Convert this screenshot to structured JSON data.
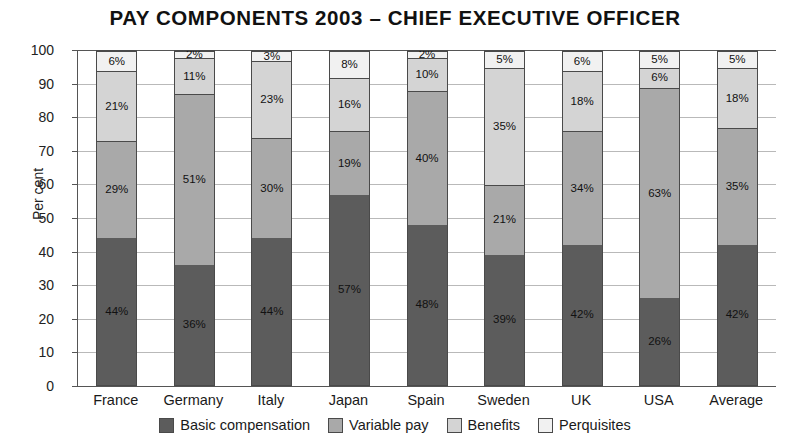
{
  "chart_data": {
    "type": "bar",
    "subtype": "stacked-bar-100",
    "title": "PAY COMPONENTS 2003 – CHIEF EXECUTIVE OFFICER",
    "xlabel": "",
    "ylabel": "Per cent",
    "ylim": [
      0,
      100
    ],
    "ytick_values": [
      0,
      10,
      20,
      30,
      40,
      50,
      60,
      70,
      80,
      90,
      100
    ],
    "ytick_labels": [
      "0",
      "10",
      "20",
      "30",
      "40",
      "50",
      "60",
      "70",
      "80",
      "90",
      "100"
    ],
    "grid": true,
    "grid_axis": "y",
    "legend_position": "bottom",
    "value_labels_suffix": "%",
    "categories": [
      "France",
      "Germany",
      "Italy",
      "Japan",
      "Spain",
      "Sweden",
      "UK",
      "USA",
      "Average"
    ],
    "series": [
      {
        "name": "Basic compensation",
        "color": "#5c5c5c",
        "values": [
          44,
          36,
          44,
          57,
          48,
          39,
          42,
          26,
          42
        ],
        "labels": [
          "44%",
          "36%",
          "44%",
          "57%",
          "48%",
          "39%",
          "42%",
          "26%",
          "42%"
        ]
      },
      {
        "name": "Variable pay",
        "color": "#a9a9a9",
        "values": [
          29,
          51,
          30,
          19,
          40,
          21,
          34,
          63,
          35
        ],
        "labels": [
          "29%",
          "51%",
          "30%",
          "19%",
          "40%",
          "21%",
          "34%",
          "63%",
          "35%"
        ]
      },
      {
        "name": "Benefits",
        "color": "#d4d4d4",
        "values": [
          21,
          11,
          23,
          16,
          10,
          35,
          18,
          6,
          18
        ],
        "labels": [
          "21%",
          "11%",
          "23%",
          "16%",
          "10%",
          "35%",
          "18%",
          "6%",
          "18%"
        ]
      },
      {
        "name": "Perquisites",
        "color": "#f1f1f1",
        "values": [
          6,
          2,
          3,
          8,
          2,
          5,
          6,
          5,
          5
        ],
        "labels": [
          "6%",
          "2%",
          "3%",
          "8%",
          "2%",
          "5%",
          "6%",
          "5%",
          "5%"
        ]
      }
    ]
  },
  "colors": {
    "basic_compensation": "#5c5c5c",
    "variable_pay": "#a9a9a9",
    "benefits": "#d4d4d4",
    "perquisites": "#f1f1f1",
    "axis": "#555555",
    "gridline": "#b9b9b9",
    "background": "#ffffff"
  }
}
